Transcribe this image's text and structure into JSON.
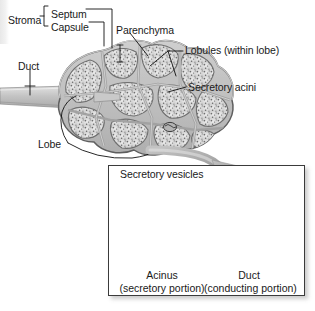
{
  "figure": {
    "background_color": "#ffffff",
    "ink_color": "#1a1a1a"
  },
  "main_diagram": {
    "name": "compound-exocrine-gland",
    "labels": [
      {
        "id": "stroma",
        "text": "Stroma",
        "x": 8,
        "y": 14
      },
      {
        "id": "septum",
        "text": "Septum",
        "x": 51,
        "y": 8
      },
      {
        "id": "capsule",
        "text": "Capsule",
        "x": 51,
        "y": 21
      },
      {
        "id": "parenchyma",
        "text": "Parenchyma",
        "x": 116,
        "y": 24
      },
      {
        "id": "lobules",
        "text": "Lobules (within lobe)",
        "x": 185,
        "y": 48
      },
      {
        "id": "duct",
        "text": "Duct",
        "x": 18,
        "y": 60
      },
      {
        "id": "acini",
        "text": "Secretory acini",
        "x": 188,
        "y": 84
      },
      {
        "id": "lobe",
        "text": "Lobe",
        "x": 38,
        "y": 143
      }
    ]
  },
  "inset": {
    "name": "acinus-and-duct-detail",
    "vesicles_label": "Secretory vesicles",
    "scale_labels": [
      {
        "id": "acinus",
        "line1": "Acinus",
        "line2": "(secretory portion)"
      },
      {
        "id": "duct",
        "line1": "Duct",
        "line2": "(conducting portion)"
      }
    ]
  },
  "colors": {
    "gland_fill": "#d8d8d8",
    "gland_outline": "#6e6e6e",
    "septum": "#b9b9b9",
    "acinar_cell": "#7d7d7d",
    "lumen": "#3a3530",
    "duct_cell": "#d3d3d3",
    "arrow": "#a8a8a8",
    "box_border": "#3b3b3b"
  }
}
